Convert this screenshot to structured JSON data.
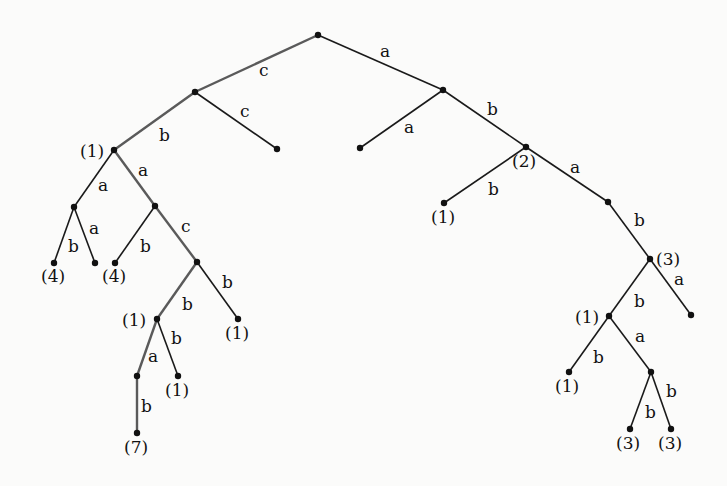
{
  "diagram": {
    "type": "labeled-tree",
    "nodes": [
      {
        "id": "root",
        "x": 318,
        "y": 35,
        "label": ""
      },
      {
        "id": "c",
        "x": 195,
        "y": 92,
        "label": ""
      },
      {
        "id": "cc",
        "x": 277,
        "y": 149,
        "label": ""
      },
      {
        "id": "cb",
        "x": 114,
        "y": 150,
        "label": "(1)",
        "lx": 80,
        "ly": 157
      },
      {
        "id": "cba",
        "x": 74,
        "y": 207,
        "label": ""
      },
      {
        "id": "cbab",
        "x": 54,
        "y": 263,
        "label": "(4)",
        "lx": 41,
        "ly": 282
      },
      {
        "id": "cbaa",
        "x": 95,
        "y": 263,
        "label": ""
      },
      {
        "id": "cbA",
        "x": 155,
        "y": 206,
        "label": ""
      },
      {
        "id": "cbAb",
        "x": 115,
        "y": 263,
        "label": "(4)",
        "lx": 102,
        "ly": 282
      },
      {
        "id": "cbAc",
        "x": 197,
        "y": 262,
        "label": ""
      },
      {
        "id": "cbAcb",
        "x": 157,
        "y": 319,
        "label": "(1)",
        "lx": 122,
        "ly": 326
      },
      {
        "id": "cbAcB",
        "x": 238,
        "y": 319,
        "label": "(1)",
        "lx": 225,
        "ly": 339
      },
      {
        "id": "cbAcba",
        "x": 137,
        "y": 376,
        "label": ""
      },
      {
        "id": "cbAcbb",
        "x": 178,
        "y": 376,
        "label": "(1)",
        "lx": 165,
        "ly": 396
      },
      {
        "id": "cbAcbab",
        "x": 137,
        "y": 433,
        "label": "(7)",
        "lx": 124,
        "ly": 453
      },
      {
        "id": "a",
        "x": 443,
        "y": 90,
        "label": ""
      },
      {
        "id": "aa",
        "x": 360,
        "y": 148,
        "label": ""
      },
      {
        "id": "ab",
        "x": 526,
        "y": 147,
        "label": "(2)",
        "lx": 512,
        "ly": 167
      },
      {
        "id": "abb",
        "x": 444,
        "y": 203,
        "label": "(1)",
        "lx": 431,
        "ly": 223
      },
      {
        "id": "aba",
        "x": 608,
        "y": 202,
        "label": ""
      },
      {
        "id": "abab",
        "x": 650,
        "y": 259,
        "label": "(3)",
        "lx": 656,
        "ly": 265
      },
      {
        "id": "ababa",
        "x": 691,
        "y": 315,
        "label": ""
      },
      {
        "id": "ababb",
        "x": 609,
        "y": 316,
        "label": "(1)",
        "lx": 575,
        "ly": 323
      },
      {
        "id": "ababbb",
        "x": 569,
        "y": 372,
        "label": "(1)",
        "lx": 555,
        "ly": 392
      },
      {
        "id": "ababba",
        "x": 651,
        "y": 372,
        "label": ""
      },
      {
        "id": "ababbab",
        "x": 630,
        "y": 429,
        "label": "(3)",
        "lx": 616,
        "ly": 449
      },
      {
        "id": "ababbaB",
        "x": 671,
        "y": 429,
        "label": "(3)",
        "lx": 658,
        "ly": 449
      }
    ],
    "edges": [
      {
        "from": "root",
        "to": "c",
        "label": "c",
        "lx": 259,
        "ly": 76,
        "hl": true
      },
      {
        "from": "c",
        "to": "cc",
        "label": "c",
        "lx": 240,
        "ly": 117,
        "hl": false
      },
      {
        "from": "c",
        "to": "cb",
        "label": "b",
        "lx": 159,
        "ly": 141,
        "hl": true
      },
      {
        "from": "cb",
        "to": "cba",
        "label": "a",
        "lx": 98,
        "ly": 191,
        "hl": false
      },
      {
        "from": "cb",
        "to": "cbA",
        "label": "a",
        "lx": 138,
        "ly": 176,
        "hl": true
      },
      {
        "from": "cba",
        "to": "cbab",
        "label": "b",
        "lx": 68,
        "ly": 252,
        "hl": false
      },
      {
        "from": "cba",
        "to": "cbaa",
        "label": "a",
        "lx": 89,
        "ly": 234,
        "hl": false
      },
      {
        "from": "cbA",
        "to": "cbAb",
        "label": "b",
        "lx": 140,
        "ly": 252,
        "hl": false
      },
      {
        "from": "cbA",
        "to": "cbAc",
        "label": "c",
        "lx": 181,
        "ly": 232,
        "hl": true
      },
      {
        "from": "cbAc",
        "to": "cbAcb",
        "label": "b",
        "lx": 182,
        "ly": 310,
        "hl": true
      },
      {
        "from": "cbAc",
        "to": "cbAcB",
        "label": "b",
        "lx": 222,
        "ly": 288,
        "hl": false
      },
      {
        "from": "cbAcb",
        "to": "cbAcba",
        "label": "a",
        "lx": 148,
        "ly": 362,
        "hl": true
      },
      {
        "from": "cbAcb",
        "to": "cbAcbb",
        "label": "b",
        "lx": 171,
        "ly": 344,
        "hl": false
      },
      {
        "from": "cbAcba",
        "to": "cbAcbab",
        "label": "b",
        "lx": 141,
        "ly": 412,
        "hl": true
      },
      {
        "from": "root",
        "to": "a",
        "label": "a",
        "lx": 380,
        "ly": 57,
        "hl": false
      },
      {
        "from": "a",
        "to": "aa",
        "label": "a",
        "lx": 404,
        "ly": 133,
        "hl": false
      },
      {
        "from": "a",
        "to": "ab",
        "label": "b",
        "lx": 487,
        "ly": 115,
        "hl": false
      },
      {
        "from": "ab",
        "to": "abb",
        "label": "b",
        "lx": 488,
        "ly": 195,
        "hl": false
      },
      {
        "from": "ab",
        "to": "aba",
        "label": "a",
        "lx": 570,
        "ly": 173,
        "hl": false
      },
      {
        "from": "aba",
        "to": "abab",
        "label": "b",
        "lx": 634,
        "ly": 226,
        "hl": false
      },
      {
        "from": "abab",
        "to": "ababa",
        "label": "a",
        "lx": 674,
        "ly": 285,
        "hl": false
      },
      {
        "from": "abab",
        "to": "ababb",
        "label": "b",
        "lx": 634,
        "ly": 307,
        "hl": false
      },
      {
        "from": "ababb",
        "to": "ababbb",
        "label": "b",
        "lx": 593,
        "ly": 363,
        "hl": false
      },
      {
        "from": "ababb",
        "to": "ababba",
        "label": "a",
        "lx": 635,
        "ly": 342,
        "hl": false
      },
      {
        "from": "ababba",
        "to": "ababbab",
        "label": "b",
        "lx": 645,
        "ly": 418,
        "hl": false
      },
      {
        "from": "ababba",
        "to": "ababbaB",
        "label": "b",
        "lx": 666,
        "ly": 397,
        "hl": false
      }
    ]
  }
}
